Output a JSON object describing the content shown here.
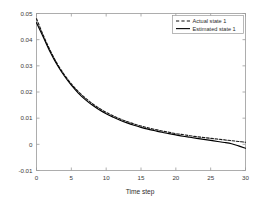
{
  "chart_data": {
    "type": "line",
    "title": "",
    "xlabel": "Time step",
    "ylabel": "",
    "xlim": [
      0,
      30
    ],
    "ylim": [
      -0.01,
      0.05
    ],
    "xticks": [
      0,
      5,
      10,
      15,
      20,
      25,
      30
    ],
    "xtick_labels": [
      "0",
      "5",
      "10",
      "15",
      "20",
      "25",
      "30"
    ],
    "yticks": [
      -0.01,
      0,
      0.01,
      0.02,
      0.03,
      0.04,
      0.05
    ],
    "ytick_labels": [
      "-0.01",
      "0",
      "0.01",
      "0.02",
      "0.03",
      "0.04",
      "0.05"
    ],
    "grid": false,
    "legend_position": "upper right",
    "x": [
      0,
      1,
      2,
      3,
      4,
      5,
      6,
      7,
      8,
      9,
      10,
      11,
      12,
      13,
      14,
      15,
      16,
      17,
      18,
      19,
      20,
      21,
      22,
      23,
      24,
      25,
      26,
      27,
      28,
      29,
      30
    ],
    "series": [
      {
        "name": "Actual state 1",
        "style": "dashed",
        "color": "#1a1a1a",
        "values": [
          0.048,
          0.0415,
          0.0357,
          0.0307,
          0.0266,
          0.0231,
          0.0202,
          0.0177,
          0.0156,
          0.0138,
          0.0122,
          0.0109,
          0.0097,
          0.0087,
          0.0078,
          0.007,
          0.0063,
          0.0057,
          0.0051,
          0.0046,
          0.0041,
          0.0037,
          0.0033,
          0.0029,
          0.0026,
          0.0023,
          0.002,
          0.0017,
          0.0014,
          0.0011,
          0.0008
        ]
      },
      {
        "name": "Estimated state 1",
        "style": "solid",
        "color": "#000000",
        "values": [
          0.0465,
          0.0408,
          0.0351,
          0.0302,
          0.0261,
          0.0226,
          0.0196,
          0.0171,
          0.015,
          0.0132,
          0.0117,
          0.0104,
          0.0092,
          0.0082,
          0.0073,
          0.0065,
          0.0058,
          0.0052,
          0.0046,
          0.0041,
          0.0036,
          0.0031,
          0.0027,
          0.0023,
          0.0019,
          0.0015,
          0.0011,
          0.0007,
          0.0002,
          -0.0006,
          -0.0015
        ]
      }
    ]
  },
  "legend": {
    "entries": [
      {
        "label": "Actual state 1",
        "style": "dashed"
      },
      {
        "label": "Estimated state 1",
        "style": "solid"
      }
    ]
  },
  "axes": {
    "x_title": "Time step",
    "y_title": ""
  }
}
